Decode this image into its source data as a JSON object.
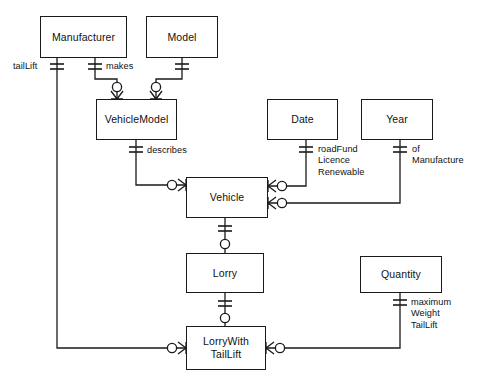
{
  "diagram": {
    "type": "entity-relationship-diagram",
    "notation": "crow's-foot",
    "width": 479,
    "height": 383,
    "background_color": "#ffffff",
    "line_color": "#1a1a1a",
    "text_color": "#111111"
  },
  "entities": [
    {
      "id": "manufacturer",
      "name": "Manufacturer",
      "x": 40,
      "y": 16,
      "w": 87,
      "h": 42
    },
    {
      "id": "model",
      "name": "Model",
      "x": 146,
      "y": 16,
      "w": 72,
      "h": 42
    },
    {
      "id": "vehiclemodel",
      "name": "VehicleModel",
      "x": 96,
      "y": 99,
      "w": 81,
      "h": 41
    },
    {
      "id": "date",
      "name": "Date",
      "x": 267,
      "y": 99,
      "w": 71,
      "h": 41
    },
    {
      "id": "year",
      "name": "Year",
      "x": 361,
      "y": 99,
      "w": 72,
      "h": 41
    },
    {
      "id": "vehicle",
      "name": "Vehicle",
      "x": 186,
      "y": 177,
      "w": 82,
      "h": 41
    },
    {
      "id": "lorry",
      "name": "Lorry",
      "x": 186,
      "y": 253,
      "w": 78,
      "h": 40
    },
    {
      "id": "quantity",
      "name": "Quantity",
      "x": 360,
      "y": 256,
      "w": 82,
      "h": 37
    },
    {
      "id": "lorrywithtaillift",
      "name": "LorryWith\nTailLift",
      "x": 186,
      "y": 326,
      "w": 80,
      "h": 44
    }
  ],
  "relationship_labels": [
    {
      "id": "taillift",
      "text": "tailLift",
      "x": 13,
      "y": 61
    },
    {
      "id": "makes",
      "text": "makes",
      "x": 94,
      "y": 61
    },
    {
      "id": "describes",
      "text": "describes",
      "x": 145,
      "y": 147
    },
    {
      "id": "roadfundlicencerenewable",
      "text": "roadFund\nLicence\nRenewable",
      "x": 320,
      "y": 145
    },
    {
      "id": "ofmanufacture",
      "text": "of\nManufacture",
      "x": 414,
      "y": 145
    },
    {
      "id": "maximumweighttaillift",
      "text": "maximum\nWeight\nTailLift",
      "x": 410,
      "y": 300
    }
  ],
  "relationships": [
    {
      "id": "rel-makes",
      "from": "manufacturer",
      "to": "vehiclemodel",
      "label": "makes",
      "from_cardinality": "one-and-only-one",
      "to_cardinality": "zero-or-many"
    },
    {
      "id": "rel-model",
      "from": "model",
      "to": "vehiclemodel",
      "label": "",
      "from_cardinality": "one-and-only-one",
      "to_cardinality": "zero-or-many"
    },
    {
      "id": "rel-describes",
      "from": "vehiclemodel",
      "to": "vehicle",
      "label": "describes",
      "from_cardinality": "one-and-only-one",
      "to_cardinality": "zero-or-many"
    },
    {
      "id": "rel-roadfund",
      "from": "date",
      "to": "vehicle",
      "label": "roadFundLicenceRenewable",
      "from_cardinality": "one-and-only-one",
      "to_cardinality": "zero-or-many"
    },
    {
      "id": "rel-ofmanu",
      "from": "year",
      "to": "vehicle",
      "label": "ofManufacture",
      "from_cardinality": "one-and-only-one",
      "to_cardinality": "zero-or-many"
    },
    {
      "id": "rel-lorry",
      "from": "vehicle",
      "to": "lorry",
      "label": "",
      "from_cardinality": "one-and-only-one",
      "to_cardinality": "zero-or-one"
    },
    {
      "id": "rel-lwt",
      "from": "lorry",
      "to": "lorrywithtaillift",
      "label": "",
      "from_cardinality": "one-and-only-one",
      "to_cardinality": "zero-or-one"
    },
    {
      "id": "rel-taillift",
      "from": "manufacturer",
      "to": "lorrywithtaillift",
      "label": "tailLift",
      "from_cardinality": "one-and-only-one",
      "to_cardinality": "zero-or-many"
    },
    {
      "id": "rel-maxweight",
      "from": "quantity",
      "to": "lorrywithtaillift",
      "label": "maximumWeightTailLift",
      "from_cardinality": "one-and-only-one",
      "to_cardinality": "zero-or-many"
    }
  ]
}
